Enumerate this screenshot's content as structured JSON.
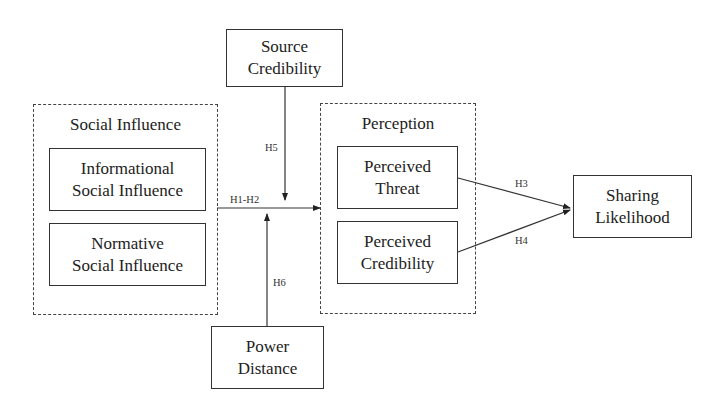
{
  "diagram": {
    "type": "conceptual-research-model",
    "groups": {
      "social_influence": {
        "title": "Social Influence",
        "items": [
          "Informational\nSocial Influence",
          "Normative\nSocial Influence"
        ]
      },
      "perception": {
        "title": "Perception",
        "items": [
          "Perceived\nThreat",
          "Perceived\nCredibility"
        ]
      }
    },
    "nodes": {
      "source_credibility": {
        "line1": "Source",
        "line2": "Credibility"
      },
      "power_distance": {
        "line1": "Power",
        "line2": "Distance"
      },
      "sharing_likelihood": {
        "line1": "Sharing",
        "line2": "Likelihood"
      },
      "informational": {
        "line1": "Informational",
        "line2": "Social Influence"
      },
      "normative": {
        "line1": "Normative",
        "line2": "Social Influence"
      },
      "threat": {
        "line1": "Perceived",
        "line2": "Threat"
      },
      "credibility": {
        "line1": "Perceived",
        "line2": "Credibility"
      }
    },
    "edges": [
      {
        "from": "Social Influence",
        "to": "Perception",
        "label": "H1-H2"
      },
      {
        "from": "Perceived Threat",
        "to": "Sharing Likelihood",
        "label": "H3"
      },
      {
        "from": "Perceived Credibility",
        "to": "Sharing Likelihood",
        "label": "H4"
      },
      {
        "from": "Source Credibility",
        "to": "H1-H2 path",
        "label": "H5"
      },
      {
        "from": "Power Distance",
        "to": "H1-H2 path",
        "label": "H6"
      }
    ],
    "labels": {
      "h12": "H1-H2",
      "h3": "H3",
      "h4": "H4",
      "h5": "H5",
      "h6": "H6"
    }
  }
}
